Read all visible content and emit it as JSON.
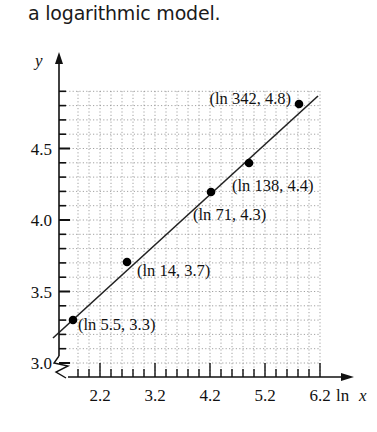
{
  "caption": "a logarithmic model.",
  "chart_data": {
    "type": "scatter",
    "title": "",
    "xlabel": "ln x",
    "ylabel": "y",
    "xticks": [
      "2.2",
      "3.2",
      "4.2",
      "5.2",
      "6.2"
    ],
    "yticks": [
      "3.0",
      "3.5",
      "4.0",
      "4.5"
    ],
    "xlim": [
      1.6,
      6.2
    ],
    "ylim": [
      3.0,
      4.9
    ],
    "grid": true,
    "axis_break": "y-axis zigzag break near 3.0",
    "points": [
      {
        "label": "(ln 5.5, 3.3)",
        "x": 1.705,
        "y": 3.3
      },
      {
        "label": "(ln 14, 3.7)",
        "x": 2.639,
        "y": 3.7
      },
      {
        "label": "(ln 71, 4.3)",
        "x": 4.263,
        "y": 4.3
      },
      {
        "label": "(ln 138, 4.4)",
        "x": 4.927,
        "y": 4.4
      },
      {
        "label": "(ln 342, 4.8)",
        "x": 5.835,
        "y": 4.8
      }
    ],
    "fit_line": {
      "type": "linear",
      "description": "best-fit line through points, y ≈ 2.26 + 0.43·ln x"
    }
  }
}
